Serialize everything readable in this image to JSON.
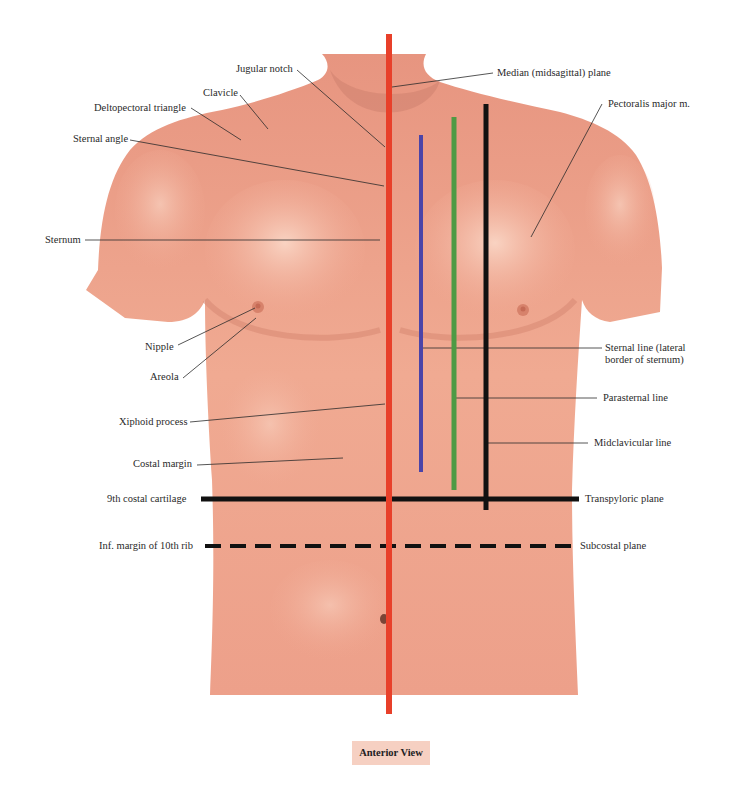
{
  "figure": {
    "caption": "Anterior View",
    "colors": {
      "median_plane": "#e8402a",
      "sternal_line": "#4b44a8",
      "parasternal_line": "#4e9a44",
      "midclavicular_line": "#111111",
      "skin": "#eea08a",
      "skin_light": "#f8c9b5",
      "caption_bg": "#f6d0c2"
    }
  },
  "labels_left": {
    "jugular_notch": "Jugular notch",
    "clavicle": "Clavicle",
    "deltopectoral_triangle": "Deltopectoral triangle",
    "sternal_angle": "Sternal angle",
    "sternum": "Sternum",
    "nipple": "Nipple",
    "areola": "Areola",
    "xiphoid_process": "Xiphoid process",
    "costal_margin": "Costal margin",
    "ninth_costal_cartilage": "9th costal cartilage",
    "inf_margin_10th_rib": "Inf. margin of 10th rib"
  },
  "labels_right": {
    "median_plane": "Median (midsagittal) plane",
    "pectoralis_major": "Pectoralis major m.",
    "sternal_line_1": "Sternal line (lateral",
    "sternal_line_2": "border of sternum)",
    "parasternal_line": "Parasternal line",
    "midclavicular_line": "Midclavicular line",
    "transpyloric_plane": "Transpyloric plane",
    "subcostal_plane": "Subcostal plane"
  }
}
